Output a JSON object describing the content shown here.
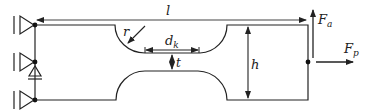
{
  "diagram": {
    "type": "mechanical-specimen-schematic",
    "colors": {
      "stroke": "#222222",
      "dimension": "#333333",
      "background": "#ffffff"
    },
    "labels": {
      "length": "l",
      "radius": "r",
      "neck_width_main": "d",
      "neck_width_sub": "k",
      "gap": "t",
      "height": "h",
      "force_axial_main": "F",
      "force_axial_sub": "a",
      "force_lateral_main": "F",
      "force_lateral_sub": "p"
    },
    "supports": [
      {
        "name": "top-support",
        "type": "fixed-triangle"
      },
      {
        "name": "middle-support",
        "type": "fixed-triangle",
        "with_diode": true
      },
      {
        "name": "bottom-support",
        "type": "fixed-triangle"
      }
    ],
    "forces": [
      {
        "name": "F_a",
        "direction": "up"
      },
      {
        "name": "F_p",
        "direction": "right"
      }
    ]
  }
}
